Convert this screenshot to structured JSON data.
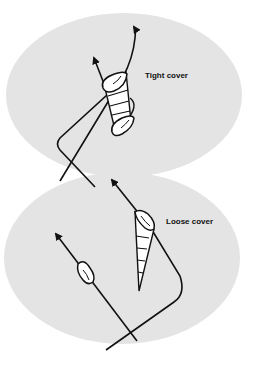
{
  "diagram": {
    "type": "sailing-tactics",
    "colors": {
      "background": "#ffffff",
      "zone_fill": "#e4e4e4",
      "stroke": "#111111",
      "boat_fill": "#ffffff"
    },
    "panels": [
      {
        "id": "tight",
        "label": "Tight cover",
        "description": "Covering boat sits directly ahead on the same tack, blanketing the trailing boat"
      },
      {
        "id": "loose",
        "label": "Loose cover",
        "description": "Covering boat stays between the trailing boat and the mark without sitting on its wind"
      }
    ]
  }
}
